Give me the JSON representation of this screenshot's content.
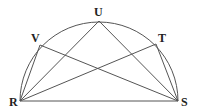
{
  "diagram": {
    "type": "semicircle-inscribed-chords",
    "colors": {
      "stroke": "#555555",
      "label": "#222222",
      "background": "#ffffff"
    },
    "points": {
      "R": {
        "label": "R",
        "x": 20,
        "y": 101
      },
      "S": {
        "label": "S",
        "x": 178,
        "y": 101
      },
      "U": {
        "label": "U",
        "x": 99,
        "y": 21
      },
      "V": {
        "label": "V",
        "x": 40,
        "y": 45
      },
      "T": {
        "label": "T",
        "x": 156,
        "y": 44
      }
    },
    "segments": [
      [
        "R",
        "S"
      ],
      [
        "R",
        "V"
      ],
      [
        "R",
        "U"
      ],
      [
        "R",
        "T"
      ],
      [
        "S",
        "V"
      ],
      [
        "S",
        "U"
      ],
      [
        "S",
        "T"
      ]
    ],
    "arc": {
      "from": "R",
      "to": "S",
      "center_x": 99,
      "center_y": 101,
      "radius": 79
    },
    "labels": {
      "R": {
        "text": "R",
        "x": 9,
        "y": 106
      },
      "S": {
        "text": "S",
        "x": 181,
        "y": 106
      },
      "U": {
        "text": "U",
        "x": 94,
        "y": 16
      },
      "V": {
        "text": "V",
        "x": 31,
        "y": 42
      },
      "T": {
        "text": "T",
        "x": 158,
        "y": 42
      }
    }
  }
}
